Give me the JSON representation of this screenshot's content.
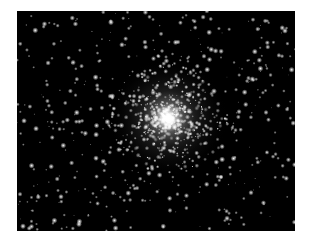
{
  "image": {
    "subject": "globular star cluster",
    "background_color": "#000000",
    "border_color": "#ffffff",
    "frame": {
      "x": 17,
      "y": 11,
      "width": 278,
      "height": 220
    },
    "cluster_core": {
      "x": 151,
      "y": 107,
      "radius": 14,
      "halo_radius": 60
    },
    "field_star_count": 520,
    "cluster_star_count": 650,
    "seed": 1337
  }
}
